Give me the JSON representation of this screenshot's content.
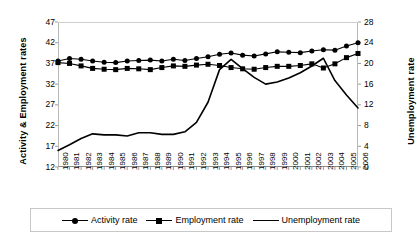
{
  "chart_data": {
    "type": "line",
    "title": "",
    "xlabel": "",
    "ylabel": "Activity & Employment rates",
    "y2label": "Unemployment rate",
    "grid": false,
    "legend_position": "bottom",
    "ylim": [
      12,
      47
    ],
    "y2lim": [
      0,
      28
    ],
    "yticks": [
      12,
      17,
      22,
      27,
      32,
      37,
      42,
      47
    ],
    "y2ticks": [
      0,
      4,
      8,
      12,
      16,
      20,
      24,
      28
    ],
    "categories": [
      "1980",
      "1981",
      "1982",
      "1983",
      "1984",
      "1985",
      "1986",
      "1987",
      "1988",
      "1989",
      "1990",
      "1991",
      "1992",
      "1993",
      "1994",
      "1995",
      "1996",
      "1997",
      "1998",
      "1999",
      "2000",
      "2001",
      "2002",
      "2003",
      "2004",
      "2005",
      "2006"
    ],
    "series": [
      {
        "name": "Activity rate",
        "axis": "left",
        "marker": "diamond",
        "values": [
          37.6,
          38.2,
          38.0,
          37.6,
          37.3,
          37.2,
          37.6,
          37.7,
          37.8,
          37.6,
          38.0,
          37.7,
          38.2,
          38.6,
          39.2,
          39.5,
          39.0,
          38.8,
          39.3,
          39.8,
          39.7,
          39.6,
          40.0,
          40.3,
          40.2,
          41.2,
          42.0
        ]
      },
      {
        "name": "Employment rate",
        "axis": "left",
        "marker": "square",
        "values": [
          37.2,
          37.0,
          36.4,
          35.8,
          35.6,
          35.5,
          35.8,
          35.7,
          35.5,
          36.0,
          36.4,
          36.3,
          36.6,
          36.8,
          36.5,
          36.0,
          35.7,
          35.6,
          36.0,
          36.3,
          36.3,
          36.5,
          36.9,
          35.9,
          36.9,
          38.4,
          39.4
        ]
      },
      {
        "name": "Unemployment rate",
        "axis": "right",
        "marker": "none",
        "values": [
          3.2,
          4.3,
          5.5,
          6.4,
          6.2,
          6.2,
          6.0,
          6.6,
          6.6,
          6.3,
          6.3,
          6.8,
          8.6,
          12.5,
          18.8,
          20.8,
          19.0,
          17.3,
          16.0,
          16.4,
          17.2,
          18.2,
          19.5,
          21.0,
          16.7,
          13.9,
          11.4
        ]
      }
    ]
  },
  "legend": {
    "items": [
      {
        "label": "Activity rate",
        "marker": "diamond"
      },
      {
        "label": "Employment rate",
        "marker": "square"
      },
      {
        "label": "Unemployment rate",
        "marker": "none"
      }
    ]
  }
}
